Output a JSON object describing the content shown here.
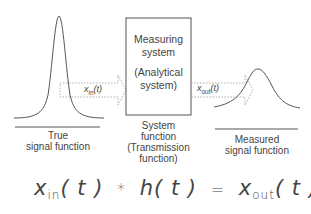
{
  "input": {
    "caption_line1": "True",
    "caption_line2": "signal function",
    "arrow_label_main": "x",
    "arrow_label_sub": "in",
    "arrow_label_arg": "(t)"
  },
  "system": {
    "box_line1": "Measuring",
    "box_line2": "system",
    "box_line3": "(Analytical",
    "box_line4": "system)",
    "caption_line1": "System",
    "caption_line2": "function",
    "caption_line3": "(Transmission",
    "caption_line4": "function)"
  },
  "output": {
    "caption_line1": "Measured",
    "caption_line2": "signal function",
    "arrow_label_main": "x",
    "arrow_label_sub": "out",
    "arrow_label_arg": "(t)"
  },
  "equation": {
    "term1_main": "x",
    "term1_sub": "in",
    "term1_arg": "( t )",
    "operator": "*",
    "term2": "h( t )",
    "equals": "=",
    "term3_main": "x",
    "term3_sub": "out",
    "term3_arg": "( t )"
  },
  "colors": {
    "line": "#555555",
    "dotted": "#888888"
  }
}
